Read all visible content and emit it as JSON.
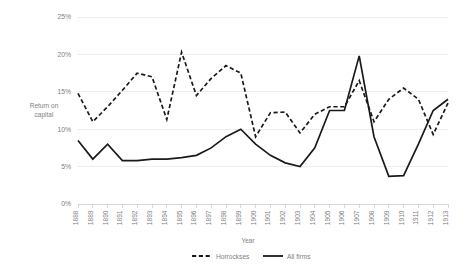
{
  "chart_data": {
    "type": "line",
    "title": "",
    "xlabel": "Year",
    "ylabel": "Return on capital",
    "ylabel_line1": "Return on",
    "ylabel_line2": "capital",
    "ylim": [
      0,
      25
    ],
    "ytick_values": [
      0,
      5,
      10,
      15,
      20,
      25
    ],
    "ytick_labels": [
      "0%",
      "5%",
      "10%",
      "15%",
      "20%",
      "25%"
    ],
    "grid": true,
    "legend_position": "bottom",
    "categories": [
      "1888",
      "1889",
      "1890",
      "1891",
      "1892",
      "1893",
      "1894",
      "1895",
      "1896",
      "1897",
      "1898",
      "1899",
      "1900",
      "1901",
      "1902",
      "1903",
      "1904",
      "1905",
      "1906",
      "1907",
      "1908",
      "1909",
      "1910",
      "1911",
      "1912",
      "1913"
    ],
    "series": [
      {
        "name": "Horrockses",
        "style": "dashed",
        "color": "#1a1a1a",
        "values": [
          14.8,
          11.0,
          13.0,
          15.2,
          17.5,
          17.0,
          11.3,
          20.3,
          14.5,
          16.8,
          18.5,
          17.5,
          9.0,
          12.2,
          12.3,
          9.5,
          12.0,
          13.0,
          13.0,
          16.5,
          11.0,
          14.0,
          15.5,
          14.0,
          9.3,
          13.5
        ]
      },
      {
        "name": "All firms",
        "style": "solid",
        "color": "#1a1a1a",
        "values": [
          8.5,
          6.0,
          8.0,
          5.8,
          5.8,
          6.0,
          6.0,
          6.2,
          6.5,
          7.5,
          9.0,
          10.0,
          8.0,
          6.5,
          5.5,
          5.0,
          7.5,
          12.5,
          12.5,
          19.8,
          9.0,
          3.7,
          3.8,
          8.0,
          12.5,
          14.0
        ]
      }
    ]
  },
  "legend": {
    "items": [
      {
        "label": "Horrockses"
      },
      {
        "label": "All firms"
      }
    ]
  }
}
